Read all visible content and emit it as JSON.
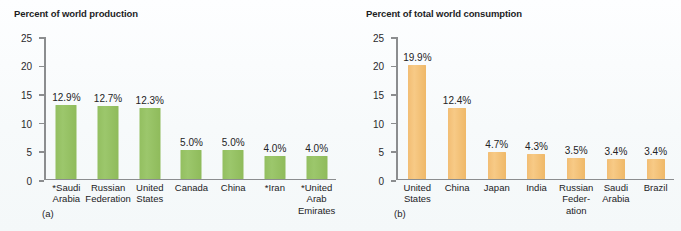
{
  "figure": {
    "background_color": "#fafcfd",
    "panels": [
      {
        "id": "a",
        "caption": "(a)",
        "title": "Percent of world production",
        "accent_color": "#93bf60"
      },
      {
        "id": "b",
        "caption": "(b)",
        "title": "Percent of total world consumption",
        "accent_color": "#f2bd73"
      }
    ]
  },
  "chart_data": [
    {
      "type": "bar",
      "title": "Percent of world production",
      "xlabel": "",
      "ylabel": "",
      "ylim": [
        0,
        25
      ],
      "yticks": [
        0,
        5,
        10,
        15,
        20,
        25
      ],
      "ytick_labels": [
        "0",
        "5",
        "10",
        "15",
        "20",
        "25"
      ],
      "grid": false,
      "legend": "none",
      "bar_color": "#93bf60",
      "caption": "(a)",
      "categories": [
        "*Saudi\nArabia",
        "Russian\nFederation",
        "United\nStates",
        "Canada",
        "China",
        "*Iran",
        "*United\nArab\nEmirates"
      ],
      "values": [
        12.9,
        12.7,
        12.3,
        5.0,
        5.0,
        4.0,
        4.0
      ],
      "value_labels": [
        "12.9%",
        "12.7%",
        "12.3%",
        "5.0%",
        "5.0%",
        "4.0%",
        "4.0%"
      ]
    },
    {
      "type": "bar",
      "title": "Percent of total world consumption",
      "xlabel": "",
      "ylabel": "",
      "ylim": [
        0,
        25
      ],
      "yticks": [
        0,
        5,
        10,
        15,
        20,
        25
      ],
      "ytick_labels": [
        "0",
        "5",
        "10",
        "15",
        "20",
        "25"
      ],
      "grid": false,
      "legend": "none",
      "bar_color": "#f2bd73",
      "caption": "(b)",
      "categories": [
        "United\nStates",
        "China",
        "Japan",
        "India",
        "Russian\nFeder-\nation",
        "Saudi\nArabia",
        "Brazil"
      ],
      "values": [
        19.9,
        12.4,
        4.7,
        4.3,
        3.5,
        3.4,
        3.4
      ],
      "value_labels": [
        "19.9%",
        "12.4%",
        "4.7%",
        "4.3%",
        "3.5%",
        "3.4%",
        "3.4%"
      ]
    }
  ]
}
